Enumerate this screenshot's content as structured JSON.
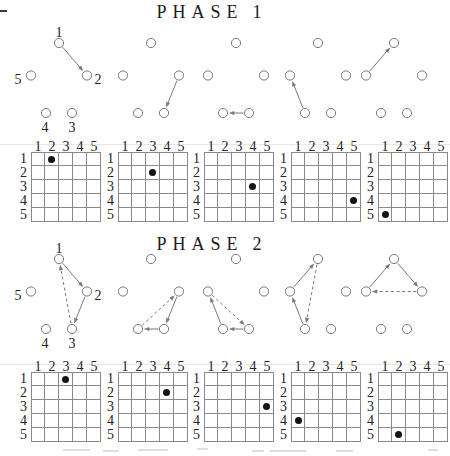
{
  "phases": [
    {
      "title_word": "PHASE",
      "title_num": "1",
      "diagrams": [
        {
          "labeled": true,
          "arrows": [
            {
              "from": 1,
              "to": 2,
              "style": "solid"
            }
          ]
        },
        {
          "labeled": false,
          "arrows": [
            {
              "from": 2,
              "to": 3,
              "style": "solid"
            }
          ]
        },
        {
          "labeled": false,
          "arrows": [
            {
              "from": 3,
              "to": 4,
              "style": "solid"
            }
          ]
        },
        {
          "labeled": false,
          "arrows": [
            {
              "from": 4,
              "to": 5,
              "style": "solid"
            }
          ]
        },
        {
          "labeled": false,
          "arrows": [
            {
              "from": 5,
              "to": 1,
              "style": "solid"
            }
          ]
        }
      ],
      "grids": [
        {
          "dot": {
            "row": 1,
            "col": 2
          }
        },
        {
          "dot": {
            "row": 2,
            "col": 3
          }
        },
        {
          "dot": {
            "row": 3,
            "col": 4
          }
        },
        {
          "dot": {
            "row": 4,
            "col": 5
          }
        },
        {
          "dot": {
            "row": 5,
            "col": 1
          }
        }
      ]
    },
    {
      "title_word": "PHASE",
      "title_num": "2",
      "diagrams": [
        {
          "labeled": true,
          "arrows": [
            {
              "from": 1,
              "to": 2,
              "style": "solid"
            },
            {
              "from": 2,
              "to": 3,
              "style": "solid"
            },
            {
              "from": 3,
              "to": 1,
              "style": "dashed"
            }
          ]
        },
        {
          "labeled": false,
          "arrows": [
            {
              "from": 2,
              "to": 3,
              "style": "solid"
            },
            {
              "from": 3,
              "to": 4,
              "style": "solid"
            },
            {
              "from": 4,
              "to": 2,
              "style": "dashed"
            }
          ]
        },
        {
          "labeled": false,
          "arrows": [
            {
              "from": 3,
              "to": 4,
              "style": "solid"
            },
            {
              "from": 4,
              "to": 5,
              "style": "solid"
            },
            {
              "from": 5,
              "to": 3,
              "style": "dashed"
            }
          ]
        },
        {
          "labeled": false,
          "arrows": [
            {
              "from": 4,
              "to": 5,
              "style": "solid"
            },
            {
              "from": 5,
              "to": 1,
              "style": "solid"
            },
            {
              "from": 1,
              "to": 4,
              "style": "dashed"
            }
          ]
        },
        {
          "labeled": false,
          "arrows": [
            {
              "from": 5,
              "to": 1,
              "style": "solid"
            },
            {
              "from": 1,
              "to": 2,
              "style": "solid"
            },
            {
              "from": 2,
              "to": 5,
              "style": "dashed"
            }
          ]
        }
      ],
      "grids": [
        {
          "dot": {
            "row": 1,
            "col": 3
          }
        },
        {
          "dot": {
            "row": 2,
            "col": 4
          }
        },
        {
          "dot": {
            "row": 3,
            "col": 5
          }
        },
        {
          "dot": {
            "row": 4,
            "col": 1
          }
        },
        {
          "dot": {
            "row": 5,
            "col": 2
          }
        }
      ]
    }
  ],
  "node_labels": [
    "1",
    "2",
    "3",
    "4",
    "5"
  ],
  "grid_headers": {
    "cols": [
      "1",
      "2",
      "3",
      "4",
      "5"
    ],
    "rows": [
      "1",
      "2",
      "3",
      "4",
      "5"
    ]
  },
  "colors": {
    "ink": "#222222",
    "diagram_gray": "#7a7a7a",
    "grid_line": "#8a8a8a",
    "dot_fill": "#141414",
    "faint_rule": "#e7e7e7"
  }
}
